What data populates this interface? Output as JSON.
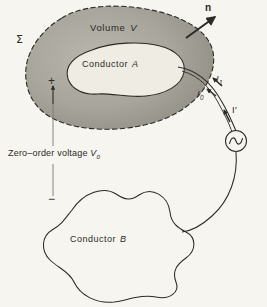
{
  "figure": {
    "background_color": "#f7f5ef",
    "ink_color": "#2b2a26",
    "shade_color": "#9d9a92",
    "width": 267,
    "height": 307
  },
  "labels": {
    "volume": {
      "text": "Volume",
      "symbol": "V"
    },
    "sigma": {
      "text": "Σ"
    },
    "conductor_a": {
      "text": "Conductor",
      "symbol": "A"
    },
    "conductor_b": {
      "text": "Conductor",
      "symbol": "B"
    },
    "normal_vector": {
      "text": "n"
    },
    "current_i1": {
      "symbol": "I",
      "subscript": "1"
    },
    "current_i0": {
      "symbol": "I",
      "subscript": "0"
    },
    "current_iprime": {
      "text": "I′"
    },
    "terminal_plus": {
      "text": "+"
    },
    "terminal_minus": {
      "text": "−"
    },
    "zero_order_voltage": {
      "text": "Zero–order voltage",
      "symbol": "V",
      "subscript": "0"
    }
  },
  "elements": {
    "volume_surface": "dashed-closed-blob-shaded",
    "conductor_a_outline": "closed-blob-unshaded",
    "conductor_b_outline": "lumpy-closed-blob-unshaded",
    "ac_source": "circle-with-sine-wave",
    "lead_wire_upper": "curve-from-conductor-a-to-source",
    "lead_wire_lower": "curve-from-source-to-conductor-b",
    "normal_arrow": "arrow-outward-from-surface",
    "voltage_arrow": "vertical-arrow-up-from-minus-to-plus"
  }
}
